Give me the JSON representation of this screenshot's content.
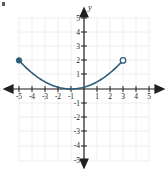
{
  "figure": {
    "title": "",
    "y_axis_label": "y",
    "x_axis_label": "",
    "curve_color": "#2e5c7a",
    "axis_color": "#231f20",
    "grid_color": "#e9eaec",
    "grid_border_color": "#e0e1e3",
    "label_color": "#231f20",
    "background": "#ffffff"
  },
  "chart_data": {
    "type": "line",
    "title": "",
    "xlabel": "",
    "ylabel": "y",
    "xlim": [
      -6,
      6
    ],
    "ylim": [
      -6,
      6
    ],
    "grid": true,
    "legend": null,
    "x_ticks": [
      -5,
      -4,
      -3,
      -2,
      -1,
      1,
      2,
      3,
      4,
      5
    ],
    "y_ticks": [
      -5,
      -4,
      -3,
      -2,
      -1,
      1,
      2,
      3,
      4,
      5
    ],
    "x_tick_labels": [
      "-5",
      "-4",
      "-3",
      "-2",
      "-1",
      "1",
      "2",
      "3",
      "4",
      "5"
    ],
    "y_tick_labels": [
      "-5",
      "-4",
      "-3",
      "-2",
      "-1",
      "1",
      "2",
      "3",
      "4",
      "5"
    ],
    "series": [
      {
        "name": "curve",
        "color": "#2e5c7a",
        "points": [
          [
            -5.0,
            2.0
          ],
          [
            -4.5,
            1.53
          ],
          [
            -4.0,
            1.13
          ],
          [
            -3.5,
            0.78
          ],
          [
            -3.0,
            0.5
          ],
          [
            -2.5,
            0.28
          ],
          [
            -2.0,
            0.13
          ],
          [
            -1.5,
            0.03
          ],
          [
            -1.0,
            0.0
          ],
          [
            -0.5,
            0.03
          ],
          [
            0.0,
            0.13
          ],
          [
            0.5,
            0.28
          ],
          [
            1.0,
            0.5
          ],
          [
            1.5,
            0.78
          ],
          [
            2.0,
            1.13
          ],
          [
            2.5,
            1.53
          ],
          [
            3.0,
            2.0
          ]
        ],
        "vertex": [
          -1,
          0
        ],
        "domain": [
          -5,
          3
        ]
      }
    ],
    "endpoints": [
      {
        "name": "left-endpoint",
        "x": -5,
        "y": 2,
        "style": "closed"
      },
      {
        "name": "right-endpoint",
        "x": 3,
        "y": 2,
        "style": "open"
      }
    ]
  },
  "x_tick_labels": [
    {
      "value": -5,
      "text": "-5"
    },
    {
      "value": -4,
      "text": "-4"
    },
    {
      "value": -3,
      "text": "-3"
    },
    {
      "value": -2,
      "text": "-2"
    },
    {
      "value": -1,
      "text": "-1"
    },
    {
      "value": 1,
      "text": "1"
    },
    {
      "value": 2,
      "text": "2"
    },
    {
      "value": 3,
      "text": "3"
    },
    {
      "value": 4,
      "text": "4"
    },
    {
      "value": 5,
      "text": "5"
    }
  ],
  "y_tick_labels": [
    {
      "value": 5,
      "text": "5"
    },
    {
      "value": 4,
      "text": "4"
    },
    {
      "value": 3,
      "text": "3"
    },
    {
      "value": 2,
      "text": "2"
    },
    {
      "value": 1,
      "text": "1"
    },
    {
      "value": -1,
      "text": "-1"
    },
    {
      "value": -2,
      "text": "-2"
    },
    {
      "value": -3,
      "text": "-3"
    },
    {
      "value": -4,
      "text": "-4"
    },
    {
      "value": -5,
      "text": "-5"
    }
  ]
}
